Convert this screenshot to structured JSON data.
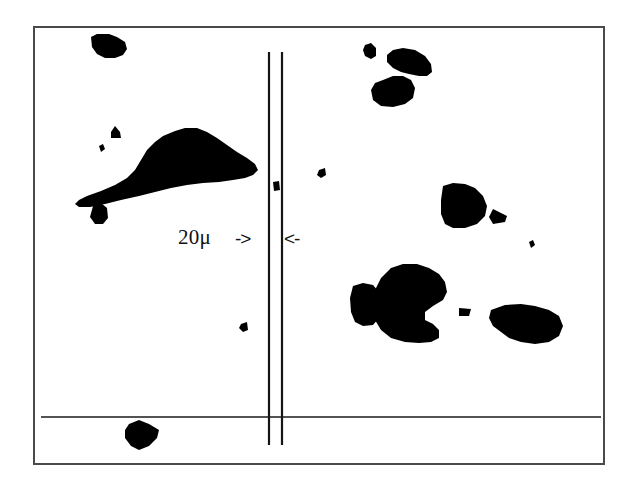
{
  "figure": {
    "type": "micrograph",
    "background_color": "#ffffff",
    "foreground_color": "#000000",
    "frame": {
      "border_color": "#4a4a4a",
      "border_width_px": 2,
      "x": 33,
      "y": 26,
      "width": 572,
      "height": 439
    },
    "annotations": {
      "scale_text": "20μ",
      "arrow_right": "->",
      "arrow_left": "<-"
    },
    "scale_bar": {
      "label": "20μ",
      "line_color": "#141414",
      "lines": [
        {
          "name": "scale-line-left",
          "x": 234,
          "y_top": 24,
          "y_bottom": 417
        },
        {
          "name": "scale-line-right",
          "x": 247,
          "y_top": 24,
          "y_bottom": 417
        }
      ]
    },
    "baseline": {
      "name": "horizontal-baseline",
      "y": 389,
      "x_start": 6,
      "x_end": 566,
      "color": "#1a1a1a"
    },
    "particles": [
      {
        "id": "particle-top-left",
        "points": "56,9 62,6 74,6 82,9 90,14 92,21 88,27 80,30 70,30 62,26 57,19"
      },
      {
        "id": "particle-left-large",
        "points": "150,100 140,103 128,108 120,114 112,122 106,132 100,142 92,150 80,157 66,163 52,168 44,172 40,176 44,179 55,179 70,176 86,172 104,168 120,164 136,160 152,157 168,155 184,154 198,152 210,150 218,147 223,142 220,136 212,130 202,124 192,117 182,110 172,104 162,100"
      },
      {
        "id": "particle-left-small-triangle",
        "points": "76,104 80,98 85,104 86,110 76,110"
      },
      {
        "id": "particle-left-dot",
        "points": "64,118 68,116 70,121 66,124"
      },
      {
        "id": "particle-left-mid",
        "points": "58,178 66,175 72,180 73,190 68,196 60,196 55,189"
      },
      {
        "id": "particle-top-right-small",
        "points": "330,17 336,15 341,20 341,28 336,31 330,28 328,22"
      },
      {
        "id": "particle-top-right-a",
        "points": "358,22 368,20 380,22 390,28 396,36 397,44 392,48 384,48 374,46 366,44 358,40 352,34 352,27"
      },
      {
        "id": "particle-top-right-b",
        "points": "348,52 358,48 368,48 376,52 380,60 378,70 370,76 358,79 346,78 338,72 336,62 340,55"
      },
      {
        "id": "particle-right-upper",
        "points": "408,158 418,155 430,156 440,160 448,168 452,178 450,188 442,196 430,200 418,200 410,196 406,186 406,172"
      },
      {
        "id": "particle-right-triangle",
        "points": "458,181 472,188 470,194 458,196 454,189"
      },
      {
        "id": "particle-right-dot",
        "points": "494,214 498,212 500,217 496,220"
      },
      {
        "id": "particle-lower-right-a",
        "points": "318,258 328,255 338,257 344,264 346,278 344,290 338,297 328,298 320,294 316,284 315,270"
      },
      {
        "id": "particle-lower-right-big",
        "points": "356,240 368,236 382,236 394,240 404,246 410,254 412,264 408,272 398,278 390,284 390,292 398,296 404,302 404,310 396,314 384,315 370,314 356,310 346,302 340,292 338,278 340,262 346,250"
      },
      {
        "id": "particle-lower-right-tiny",
        "points": "424,280 436,281 434,288 424,288"
      },
      {
        "id": "particle-lower-right-c",
        "points": "456,282 470,277 486,276 500,278 514,282 524,288 528,298 524,308 514,314 500,316 486,314 474,310 466,304 458,298 454,290"
      },
      {
        "id": "particle-bottom",
        "points": "94,396 104,392 114,396 124,402 122,410 114,418 104,422 96,418 90,410 90,402"
      },
      {
        "id": "particle-mid-dot-a",
        "points": "284,142 290,140 291,147 286,150 282,147"
      },
      {
        "id": "particle-mid-dot-b",
        "points": "206,296 212,294 213,302 208,304 204,300"
      },
      {
        "id": "particle-line-mark",
        "points": "238,154 244,153 245,162 239,163"
      }
    ]
  }
}
